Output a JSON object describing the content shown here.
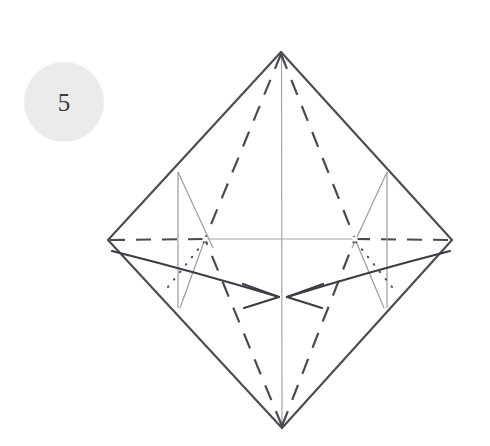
{
  "page": {
    "background_color": "#ffffff",
    "width": 490,
    "height": 446
  },
  "step_badge": {
    "number": "5",
    "shape": "circle",
    "fill_color": "#ebebeb",
    "text_color": "#3a3a3a"
  },
  "diagram": {
    "type": "origami-crease-diagram",
    "colors": {
      "edge": "#4a4a52",
      "crease_valley_dashed": "#4a4a52",
      "crease_thin": "#9a9aa2",
      "dotted_hidden": "#55555c",
      "arrow": "#3c3c44"
    },
    "vertices": {
      "top": [
        281,
        52
      ],
      "bottom": [
        282,
        428
      ],
      "left": [
        108,
        240
      ],
      "right": [
        452,
        240
      ],
      "node_left": [
        205,
        239
      ],
      "node_right": [
        355,
        239
      ],
      "arrow_meet_left": [
        279,
        297
      ],
      "arrow_meet_right": [
        287,
        297
      ]
    },
    "elements": [
      "outer-diamond-outline",
      "horizontal-center-dashed-line",
      "vertical-center-thin-line",
      "dashed-diagonals-top-to-nodes",
      "dashed-diagonals-bottom-to-nodes",
      "thin-vertical-lines-at-nodes",
      "thin-diagonal-creases",
      "dotted-hidden-creases",
      "curved-fold-arrow-left",
      "curved-fold-arrow-right"
    ]
  }
}
